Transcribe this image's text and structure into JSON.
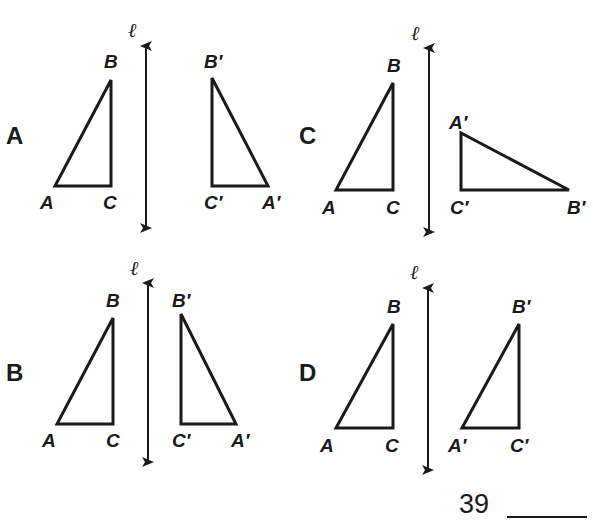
{
  "question": {
    "number": "39",
    "answer_blank": ""
  },
  "line_label": "ℓ",
  "panels": [
    {
      "id": "A",
      "letter": "A",
      "original": {
        "A": "A",
        "B": "B",
        "C": "C"
      },
      "image": {
        "A": "A′",
        "B": "B′",
        "C": "C′"
      },
      "description": "Right triangle ABC to the left of line ℓ; image A′B′C′ is its mirror reflection across ℓ."
    },
    {
      "id": "B",
      "letter": "B",
      "original": {
        "A": "A",
        "B": "B",
        "C": "C"
      },
      "image": {
        "A": "A′",
        "B": "B′",
        "C": "C′"
      },
      "description": "Right triangle ABC to the left of line ℓ; image A′B′C′ is its mirror reflection across ℓ (closer to the line)."
    },
    {
      "id": "C",
      "letter": "C",
      "original": {
        "A": "A",
        "B": "B",
        "C": "C"
      },
      "image": {
        "A": "A′",
        "B": "B′",
        "C": "C′"
      },
      "description": "Right triangle ABC to the left of line ℓ; image A′B′C′ is rotated so the long leg lies horizontal."
    },
    {
      "id": "D",
      "letter": "D",
      "original": {
        "A": "A",
        "B": "B",
        "C": "C"
      },
      "image": {
        "A": "A′",
        "B": "B′",
        "C": "C′"
      },
      "description": "Right triangle ABC to the left of line ℓ; image A′B′C′ is a translation (same orientation)."
    }
  ]
}
